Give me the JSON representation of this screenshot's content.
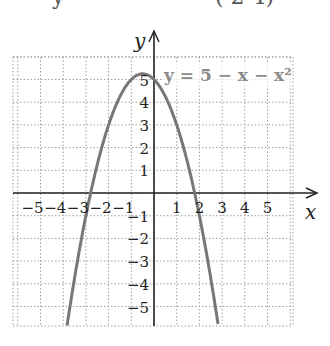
{
  "header_partial": {
    "left": "y",
    "right": "( 2  4)"
  },
  "chart_data": {
    "type": "line",
    "title": "",
    "equation_label": "y = 5 − x − x²",
    "xlabel": "x",
    "ylabel": "y",
    "xlim": [
      -6,
      6
    ],
    "ylim": [
      -6,
      6
    ],
    "grid": true,
    "x_ticks": [
      -5,
      -4,
      -3,
      -2,
      -1,
      1,
      2,
      3,
      4,
      5
    ],
    "y_ticks": [
      5,
      4,
      3,
      2,
      1,
      -1,
      -2,
      -3,
      -4,
      -5
    ],
    "series": [
      {
        "name": "y = 5 - x - x^2",
        "function": "5 - x - x^2",
        "x": [
          -3.8,
          -3,
          -2,
          -1,
          -0.5,
          0,
          1,
          2,
          2.8
        ],
        "y": [
          -5.64,
          -1,
          3,
          5,
          5.25,
          5,
          3,
          -1,
          -5.64
        ],
        "color": "#777777"
      }
    ],
    "vertex": [
      -0.5,
      5.25
    ],
    "x_intercepts": [
      -2.79,
      1.79
    ],
    "y_intercept": 5
  },
  "colors": {
    "axis": "#222222",
    "grid": "#a0a0a0",
    "curve": "#777777",
    "equation": "#8a8a8a"
  }
}
